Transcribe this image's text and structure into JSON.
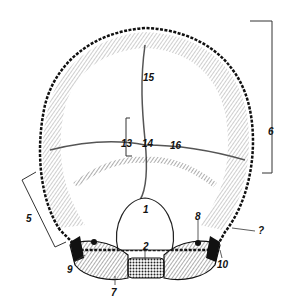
{
  "figure": {
    "labels": [
      {
        "id": "1",
        "text": "1",
        "x": 145,
        "y": 205
      },
      {
        "id": "2",
        "text": "2",
        "x": 145,
        "y": 242
      },
      {
        "id": "5",
        "text": "5",
        "x": 5,
        "y": 213
      },
      {
        "id": "6",
        "text": "6",
        "x": 270,
        "y": 127
      },
      {
        "id": "7a",
        "text": "7",
        "x": 111,
        "y": 290
      },
      {
        "id": "7b",
        "text": "?",
        "x": 258,
        "y": 226
      },
      {
        "id": "8",
        "text": "8",
        "x": 195,
        "y": 212
      },
      {
        "id": "9",
        "text": "9",
        "x": 67,
        "y": 265
      },
      {
        "id": "10",
        "text": "10",
        "x": 217,
        "y": 260
      },
      {
        "id": "13",
        "text": "13",
        "x": 121,
        "y": 139
      },
      {
        "id": "14",
        "text": "14",
        "x": 142,
        "y": 139
      },
      {
        "id": "15",
        "text": "15",
        "x": 143,
        "y": 73
      },
      {
        "id": "16",
        "text": "16",
        "x": 170,
        "y": 141
      }
    ]
  }
}
